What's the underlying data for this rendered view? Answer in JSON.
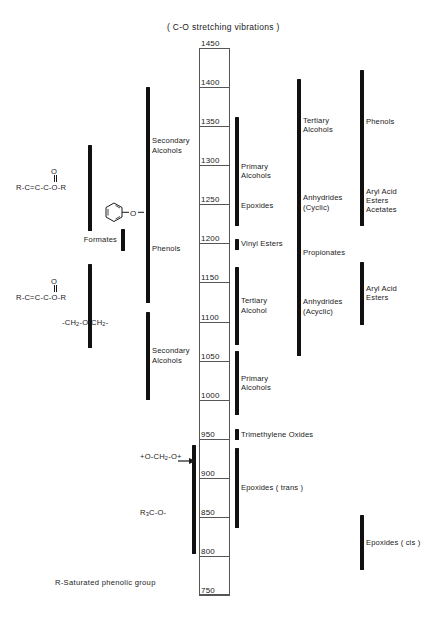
{
  "title": "( C-O stretching vibrations )",
  "footnote": "R-Saturated phenolic group",
  "axis": {
    "name": "wavenumber-scale",
    "max": 1450,
    "min": 750,
    "step": 50,
    "ticks": [
      1450,
      1400,
      1350,
      1300,
      1250,
      1200,
      1150,
      1100,
      1050,
      1000,
      950,
      900,
      850,
      800,
      750
    ]
  },
  "structures": [
    {
      "name": "acrylate-ester-upper",
      "html": "R-C=C-C-O-R",
      "carbonyl": "O"
    },
    {
      "name": "phenyl-ether",
      "html": "-O-"
    },
    {
      "name": "acrylate-ester-lower",
      "html": "R-C=C-C-O-R",
      "carbonyl": "O"
    },
    {
      "name": "methylene-ether",
      "html": "-CH<sub>2</sub>-O-CH<sub>2</sub>-"
    },
    {
      "name": "formal-group",
      "html": "+O-CH<sub>2</sub>-O+"
    },
    {
      "name": "tert-alkoxy",
      "html": "R<sub>3</sub>C-O-"
    }
  ],
  "chart_data": {
    "type": "bar",
    "orientation": "vertical-ranges",
    "title": "( C-O stretching vibrations )",
    "xlabel": "",
    "ylabel": "Wavenumber (cm-1)",
    "ylim": [
      750,
      1450
    ],
    "ytick_step": 50,
    "grid": false,
    "legend": "none",
    "note": "Correlation chart of C-O stretching frequency ranges; each bar spans the absorption range of a functional group.",
    "columns": [
      {
        "name": "col-structures-left",
        "bars": [
          {
            "label": "",
            "structure": "R-C=C-C-O-R",
            "range": [
              1326,
              1216
            ]
          },
          {
            "label": "",
            "structure": "-CH2-O-CH2-",
            "range": [
              1174,
              1066
            ]
          }
        ]
      },
      {
        "name": "col-inner-left",
        "bars": [
          {
            "label": "Secondary\nAlcohols",
            "range": [
              1400,
              1250
            ]
          },
          {
            "label": "Phenols",
            "range": [
              1262,
              1124
            ]
          },
          {
            "label": "Secondary\nAlcohols",
            "range": [
              1112,
              1000
            ]
          }
        ]
      },
      {
        "name": "col-misc-left",
        "bars": [
          {
            "label": "Formates",
            "range": [
              1218,
              1190
            ]
          }
        ]
      },
      {
        "name": "col-right-near",
        "bars": [
          {
            "label": "Primary\nAlcohols",
            "range": [
              1362,
              1222
            ]
          },
          {
            "label": "Epoxides",
            "range": [
              1272,
              1224
            ]
          },
          {
            "label": "Vinyl Esters",
            "range": [
              1206,
              1192
            ]
          },
          {
            "label": "Tertiary\nAlcohol",
            "range": [
              1170,
              1070
            ]
          },
          {
            "label": "Primary\nAlcohols",
            "range": [
              1062,
              980
            ]
          },
          {
            "label": "Trimethylene Oxides",
            "range": [
              962,
              948
            ]
          },
          {
            "label": "Epoxides ( trans )",
            "range": [
              938,
              836
            ]
          }
        ]
      },
      {
        "name": "col-right-mid",
        "bars": [
          {
            "label": "Tertiary\nAlcohols",
            "range": [
              1410,
              1292
            ]
          },
          {
            "label": "Anhydrides\n(Cyclic)",
            "range": [
              1308,
              1196
            ]
          },
          {
            "label": "Propionates",
            "range": [
              1198,
              1178
            ]
          },
          {
            "label": "Anhydrides\n(Acyclic)",
            "range": [
              1182,
              1056
            ]
          }
        ]
      },
      {
        "name": "col-right-far",
        "bars": [
          {
            "label": "Phenols",
            "range": [
              1422,
              1288
            ]
          },
          {
            "label": "Aryl Acid\nEsters",
            "range": [
              1298,
              1222
            ]
          },
          {
            "label": "Acetates",
            "range": [
              1256,
              1230
            ]
          },
          {
            "label": "Aryl Acid\nEsters",
            "range": [
              1176,
              1096
            ]
          },
          {
            "label": "Epoxides ( cis )",
            "range": [
              852,
              782
            ]
          }
        ]
      },
      {
        "name": "col-tert-alkoxy",
        "bars": [
          {
            "label": "",
            "structure": "R3C-O-",
            "range": [
              942,
              802
            ]
          }
        ]
      }
    ]
  }
}
